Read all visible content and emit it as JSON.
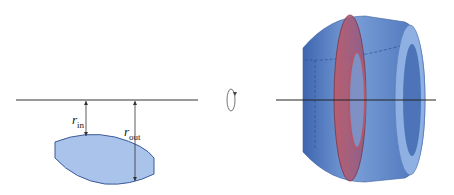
{
  "left_panel": {
    "label_inner": {
      "var": "r",
      "sub": "in"
    },
    "label_outer": {
      "var": "r",
      "sub": "out"
    },
    "region_color": "#a9c3ea",
    "region_stroke": "#3a5a9a"
  },
  "rotation_symbol": "rotate-around-axis",
  "right_panel": {
    "solid_color": "#5f86c8",
    "washer_color": "#c96a78"
  }
}
